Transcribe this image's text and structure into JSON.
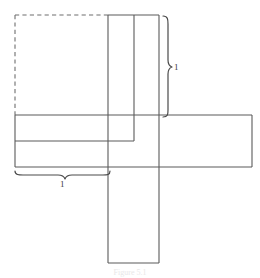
{
  "figure": {
    "kind": "geometry-net-diagram",
    "caption": "Figure 5.1",
    "stroke_color": "#5a5a5a",
    "dashed_stroke_color": "#6e6e6e",
    "background_color": "#ffffff",
    "label_color": "#3a3a3a"
  },
  "dimensions": {
    "right_brace": {
      "label": "1",
      "orientation": "vertical",
      "measures": "height of upper vertical strip"
    },
    "bottom_brace": {
      "label": "1",
      "orientation": "horizontal",
      "measures": "width of left portion of horizontal band"
    }
  },
  "shapes": {
    "dashed_square": {
      "name": "dashed-square",
      "x": 15,
      "y": 15,
      "width": 93,
      "height": 100,
      "style": "dashed"
    },
    "vertical_strip": {
      "name": "vertical-strip",
      "x": 108,
      "y": 15,
      "width": 51,
      "height": 248,
      "style": "solid"
    },
    "inner_vertical_line": {
      "name": "inner-vertical-line",
      "x": 134,
      "y_top": 15,
      "y_bottom": 141
    },
    "horizontal_band": {
      "name": "horizontal-band",
      "x": 15,
      "y": 115,
      "width": 237,
      "height": 52,
      "style": "solid"
    },
    "inner_horizontal_line": {
      "name": "inner-horizontal-line",
      "y": 141,
      "x_left": 15,
      "x_right": 134
    }
  }
}
